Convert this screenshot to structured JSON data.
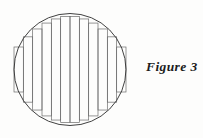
{
  "figure": {
    "caption": "Figure 3",
    "caption_x": 146,
    "caption_y": 60,
    "background_color": "#fdfdfc",
    "ink_color": "#3a3a3a",
    "circle_stroke_color": "#2b2b2b",
    "rect_stroke_color": "#6b6b6b",
    "circle_stroke_width": 0.9,
    "rect_stroke_width": 0.7
  },
  "chart_data": {
    "type": "diagram",
    "title": "Figure 3",
    "circle": {
      "center_x": 70,
      "center_y": 69.5,
      "radius": 56
    },
    "strips": {
      "count": 12,
      "width": 9.3333,
      "left_edge_x": 14,
      "right_edge_x": 126,
      "note": "Each rectangle spans one strip horizontally; its half-height equals the circle half-chord evaluated at the strip edge nearer the circle's vertical centre line, so rectangles are inscribed."
    },
    "rectangles": [
      {
        "index": 1,
        "x0": 14.0,
        "x1": 23.3333,
        "half_height": 22.5,
        "top_y": 47.0,
        "bottom_y": 92.0
      },
      {
        "index": 2,
        "x0": 23.3333,
        "x1": 32.6667,
        "half_height": 32.6599,
        "top_y": 36.8401,
        "bottom_y": 102.1599
      },
      {
        "index": 3,
        "x0": 32.6667,
        "x1": 42.0,
        "half_height": 40.532,
        "top_y": 28.968,
        "bottom_y": 110.032
      },
      {
        "index": 4,
        "x0": 42.0,
        "x1": 51.3333,
        "half_height": 46.4326,
        "top_y": 23.0674,
        "bottom_y": 115.9326
      },
      {
        "index": 5,
        "x0": 51.3333,
        "x1": 60.6667,
        "half_height": 50.5425,
        "top_y": 18.9575,
        "bottom_y": 120.0425
      },
      {
        "index": 6,
        "x0": 60.6667,
        "x1": 70.0,
        "half_height": 52.936,
        "top_y": 16.564,
        "bottom_y": 122.436
      },
      {
        "index": 7,
        "x0": 70.0,
        "x1": 79.3333,
        "half_height": 52.936,
        "top_y": 16.564,
        "bottom_y": 122.436
      },
      {
        "index": 8,
        "x0": 79.3333,
        "x1": 88.6667,
        "half_height": 50.5425,
        "top_y": 18.9575,
        "bottom_y": 120.0425
      },
      {
        "index": 9,
        "x0": 88.6667,
        "x1": 98.0,
        "half_height": 46.4326,
        "top_y": 23.0674,
        "bottom_y": 115.9326
      },
      {
        "index": 10,
        "x0": 98.0,
        "x1": 107.3333,
        "half_height": 40.532,
        "top_y": 28.968,
        "bottom_y": 110.032
      },
      {
        "index": 11,
        "x0": 107.3333,
        "x1": 116.6667,
        "half_height": 32.6599,
        "top_y": 36.8401,
        "bottom_y": 102.1599
      },
      {
        "index": 12,
        "x0": 116.6667,
        "x1": 126.0,
        "half_height": 22.5,
        "top_y": 47.0,
        "bottom_y": 92.0
      }
    ],
    "grid": false,
    "legend": null,
    "xlabel": "",
    "ylabel": ""
  }
}
